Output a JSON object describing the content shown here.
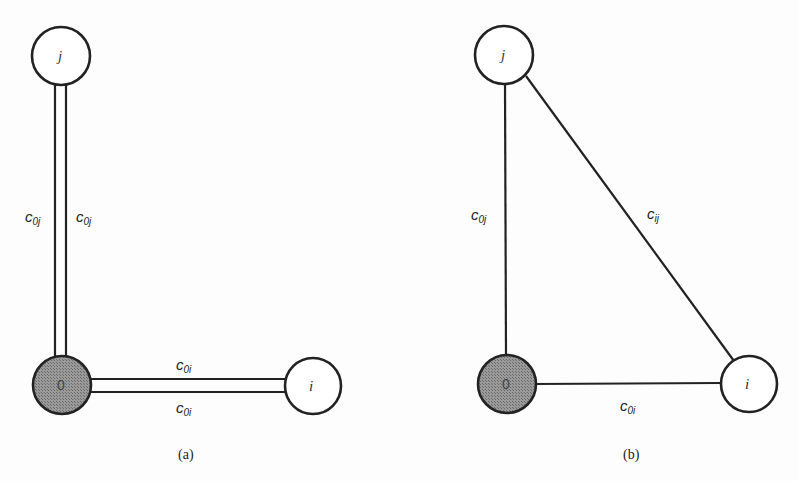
{
  "figure": {
    "panel_a": {
      "caption": "(a)",
      "nodes": {
        "j": {
          "label": "j"
        },
        "depot": {
          "label": "0"
        },
        "i": {
          "label": "i"
        }
      },
      "edges": {
        "c0j_left": {
          "base": "c",
          "sub": "0j"
        },
        "c0j_right": {
          "base": "c",
          "sub": "0j"
        },
        "c0i_top": {
          "base": "c",
          "sub": "0i"
        },
        "c0i_bottom": {
          "base": "c",
          "sub": "0i"
        }
      }
    },
    "panel_b": {
      "caption": "(b)",
      "nodes": {
        "j": {
          "label": "j"
        },
        "depot": {
          "label": "0"
        },
        "i": {
          "label": "i"
        }
      },
      "edges": {
        "c0j": {
          "base": "c",
          "sub": "0j"
        },
        "cij": {
          "base": "c",
          "sub": "ij"
        },
        "c0i": {
          "base": "c",
          "sub": "0i"
        }
      }
    },
    "colors": {
      "line": "#222222",
      "depot_fill": "#8a8a8a",
      "node_fill": "#ffffff"
    }
  }
}
